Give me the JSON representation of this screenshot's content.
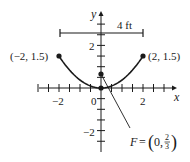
{
  "figure": {
    "type": "parabola-diagram",
    "equation_implied": "y = (3/8) x^2",
    "axes": {
      "x_label": "x",
      "y_label": "y",
      "x_tick_labels": [
        {
          "value": -2,
          "text": "−2"
        },
        {
          "value": 0,
          "text": "0"
        },
        {
          "value": 2,
          "text": "2"
        }
      ],
      "y_tick_labels": [
        {
          "value": 2,
          "text": "2"
        },
        {
          "value": -2,
          "text": "−2"
        }
      ],
      "x_range": [
        -3,
        3.2
      ],
      "y_range": [
        -3,
        3
      ],
      "tick_step": 0.5
    },
    "width_bar": {
      "label": "4 ft",
      "from_x": -2,
      "to_x": 2,
      "at_y": 2.6
    },
    "points": [
      {
        "name": "left-endpoint",
        "x": -2,
        "y": 1.5,
        "label": "(−2, 1.5)"
      },
      {
        "name": "right-endpoint",
        "x": 2,
        "y": 1.5,
        "label": "(2, 1.5)"
      },
      {
        "name": "vertex",
        "x": 0,
        "y": 0,
        "label": ""
      },
      {
        "name": "focus",
        "x": 0,
        "y": 0.6667,
        "label": ""
      }
    ],
    "focus_label": {
      "prefix": "F = ",
      "x_text": "0",
      "y_numerator": "2",
      "y_denominator": "3"
    },
    "colors": {
      "ink": "#1a1a1a",
      "background": "#ffffff"
    }
  }
}
